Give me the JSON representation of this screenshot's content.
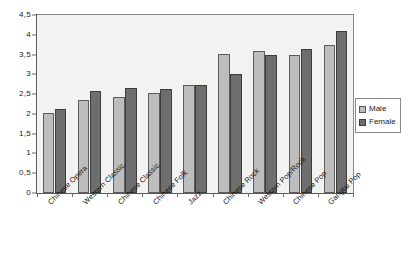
{
  "chart_data": {
    "type": "bar",
    "title": "",
    "subtitle": "",
    "xlabel": "",
    "ylabel": "",
    "ylim": [
      0,
      4.5
    ],
    "grid": false,
    "legend_position": "right",
    "decimal_separator": ",",
    "categories": [
      "Chinese Opera",
      "Western Classic",
      "Chinese Classic",
      "Chinese Folk",
      "Jazz",
      "Chinese Rock",
      "Western Pop/Rock",
      "Chinese Pop",
      "Gangtai Pop"
    ],
    "ytick_labels": [
      "0",
      "0,5",
      "1",
      "1,5",
      "2",
      "2,5",
      "3",
      "3,5",
      "4",
      "4,5"
    ],
    "ytick_values": [
      0,
      0.5,
      1,
      1.5,
      2,
      2.5,
      3,
      3.5,
      4,
      4.5
    ],
    "series": [
      {
        "name": "Male",
        "color": "#bdbdbd",
        "values": [
          2.02,
          2.36,
          2.42,
          2.52,
          2.72,
          3.52,
          3.6,
          3.5,
          3.75
        ]
      },
      {
        "name": "Female",
        "color": "#6e6e6e",
        "values": [
          2.13,
          2.57,
          2.65,
          2.62,
          2.72,
          3.02,
          3.48,
          3.65,
          4.1
        ]
      }
    ]
  },
  "legend": {
    "items": [
      {
        "label": "Male",
        "swatch": "male"
      },
      {
        "label": "Female",
        "swatch": "female"
      }
    ]
  }
}
